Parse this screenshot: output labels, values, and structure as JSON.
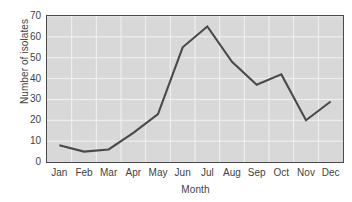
{
  "chart_data": {
    "type": "line",
    "title": "",
    "xlabel": "Month",
    "ylabel": "Number of isolates",
    "categories": [
      "Jan",
      "Feb",
      "Mar",
      "Apr",
      "May",
      "Jun",
      "Jul",
      "Aug",
      "Sep",
      "Oct",
      "Nov",
      "Dec"
    ],
    "values": [
      8,
      5,
      6,
      14,
      23,
      55,
      65,
      48,
      37,
      42,
      20,
      29
    ],
    "series": [
      {
        "name": "Number of isolates",
        "values": [
          8,
          5,
          6,
          14,
          23,
          55,
          65,
          48,
          37,
          42,
          20,
          29
        ]
      }
    ],
    "ylim": [
      0,
      70
    ],
    "yticks": [
      0,
      10,
      20,
      30,
      40,
      50,
      60,
      70
    ],
    "ytick_labels": [
      "0",
      "10",
      "20",
      "30",
      "40",
      "50",
      "60",
      "70"
    ],
    "xtick_labels": [
      "Jan",
      "Feb",
      "Mar",
      "Apr",
      "May",
      "Jun",
      "Jul",
      "Aug",
      "Sep",
      "Oct",
      "Nov",
      "Dec"
    ],
    "grid": true,
    "legend": false,
    "markers": false,
    "colors": {
      "line": "#4a4a4a",
      "plot_background": "#d8d8d8",
      "gridline": "#f2f2f2",
      "axis": "#4a4a4a",
      "text": "#3f3f3f",
      "figure_background": "#ffffff"
    }
  }
}
